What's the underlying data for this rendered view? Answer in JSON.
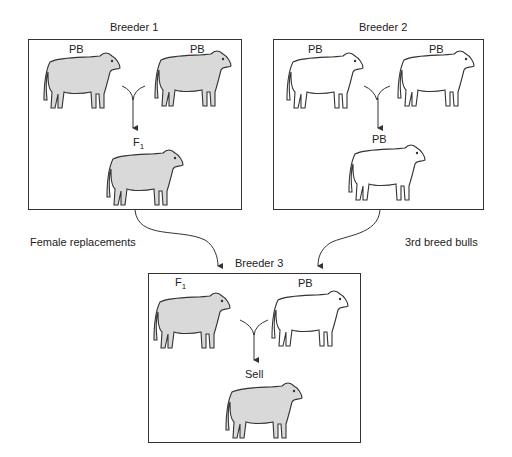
{
  "diagram": {
    "colors": {
      "shaded": "#d9d9d9",
      "unshaded": "#ffffff",
      "stroke": "#333333"
    },
    "breeder1": {
      "title": "Breeder 1",
      "parent_left": "PB",
      "parent_right": "PB",
      "offspring": "F",
      "offspring_sub": "1"
    },
    "breeder2": {
      "title": "Breeder 2",
      "parent_left": "PB",
      "parent_right": "PB",
      "offspring": "PB"
    },
    "breeder3": {
      "title": "Breeder 3",
      "parent_left": "F",
      "parent_left_sub": "1",
      "parent_right": "PB",
      "offspring": "Sell"
    },
    "flows": {
      "left": "Female replacements",
      "right": "3rd breed bulls"
    }
  }
}
